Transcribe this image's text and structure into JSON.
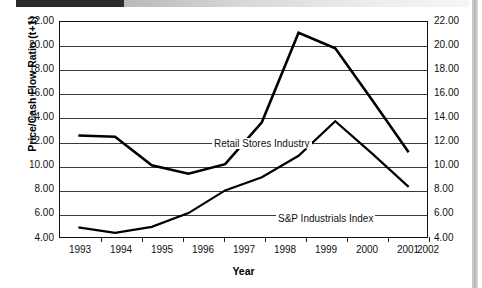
{
  "decor": {
    "top_bar_name": "header-rule",
    "right_rail_name": "page-edge-rail"
  },
  "chart_data": {
    "type": "line",
    "title": "",
    "xlabel": "Year",
    "ylabel": "Price/Cash Flow Ratio (t+1)",
    "categories": [
      "1993",
      "1994",
      "1995",
      "1996",
      "1997",
      "1998",
      "1999",
      "2000",
      "2001",
      "2002"
    ],
    "ylim": [
      4.0,
      22.0
    ],
    "ytick_step": 2.0,
    "yticks": [
      "22.00",
      "20.00",
      "18.00",
      "16.00",
      "14.00",
      "12.00",
      "10.00",
      "8.00",
      "6.00",
      "4.00"
    ],
    "ytick_values": [
      22.0,
      20.0,
      18.0,
      16.0,
      14.0,
      12.0,
      10.0,
      8.0,
      6.0,
      4.0
    ],
    "gridlines": [
      20.0,
      18.0,
      16.0,
      14.0,
      12.0,
      10.0,
      8.0,
      6.0
    ],
    "grid": true,
    "legend_position": "inline-annotation",
    "dual_y_axis": true,
    "series": [
      {
        "name": "Retail Stores Industry",
        "color": "#000000",
        "values": [
          12.5,
          12.4,
          10.0,
          9.3,
          10.1,
          13.6,
          21.1,
          19.8,
          15.5,
          11.1
        ]
      },
      {
        "name": "S&P Industrials Index",
        "color": "#000000",
        "values": [
          4.8,
          4.35,
          4.85,
          6.0,
          7.9,
          9.0,
          10.8,
          13.7,
          11.0,
          8.2
        ]
      }
    ],
    "annotations": [
      {
        "text": "Retail Stores Industry",
        "anchor": "retail-series"
      },
      {
        "text": "S&P Industrials Index",
        "anchor": "snp-series"
      }
    ]
  }
}
